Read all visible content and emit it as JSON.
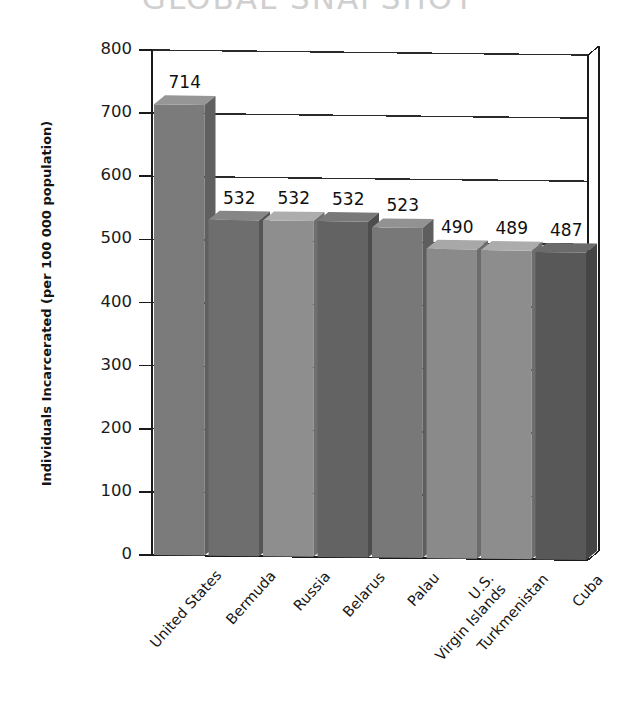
{
  "chart_data": {
    "type": "bar",
    "title": "GLOBAL SNAPSHOT",
    "xlabel": "",
    "ylabel": "Individuals Incarcerated (per 100 000 population)",
    "ylim": [
      0,
      800
    ],
    "ytick_labels": [
      "800",
      "700",
      "600",
      "500",
      "400",
      "300",
      "200",
      "100",
      "0"
    ],
    "ytick_values": [
      800,
      700,
      600,
      500,
      400,
      300,
      200,
      100,
      0
    ],
    "grid": true,
    "legend": "none",
    "style": "3d-bar-grayscale",
    "categories": [
      "United States",
      "Bermuda",
      "Russia",
      "Belarus",
      "Palau",
      "U.S. Virgin Islands",
      "Turkmenistan",
      "Cuba"
    ],
    "category_lines": [
      [
        "United States"
      ],
      [
        "Bermuda"
      ],
      [
        "Russia"
      ],
      [
        "Belarus"
      ],
      [
        "Palau"
      ],
      [
        "U.S.",
        "Virgin Islands"
      ],
      [
        "Turkmenistan"
      ],
      [
        "Cuba"
      ]
    ],
    "values": [
      714,
      532,
      532,
      532,
      523,
      490,
      489,
      487
    ],
    "value_labels": [
      "714",
      "532",
      "532",
      "532",
      "523",
      "490",
      "489",
      "487"
    ],
    "bar_colors": [
      "#7b7b7b",
      "#6e6e6e",
      "#8e8e8e",
      "#636363",
      "#787878",
      "#8a8a8a",
      "#8d8d8d",
      "#585858"
    ]
  },
  "colors": {
    "axis": "#1a1a1a",
    "grid": "#2a2a2a",
    "title": "#cfcfcf",
    "text": "#141414",
    "background": "#ffffff"
  }
}
